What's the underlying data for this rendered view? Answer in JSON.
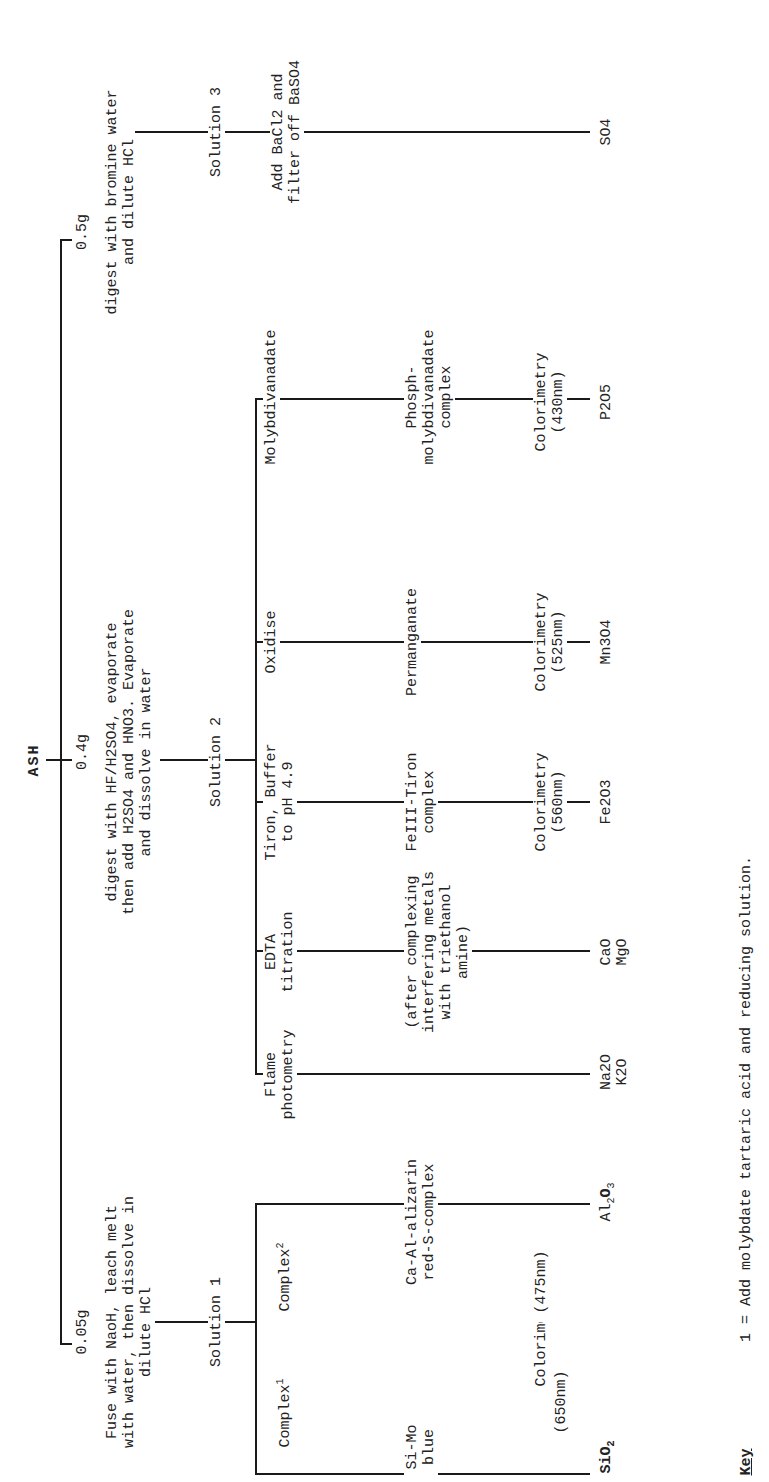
{
  "root": {
    "label": "ASH"
  },
  "branches": [
    {
      "id": "b1",
      "mass": "0.05g",
      "procedure": [
        "Fuse with NaoH, leach melt",
        "with water, then dissolve in",
        "dilute HCl"
      ],
      "solution": "Solution 1",
      "methods": [
        {
          "reagent": "Complex",
          "reagent_sup": "1",
          "complex": [
            "Si-Mo",
            "blue"
          ],
          "measurement": [
            "(650nm)"
          ],
          "product": "SiO",
          "product_sub": "2"
        },
        {
          "reagent": "Complex",
          "reagent_sup": "2",
          "complex": [
            "Ca-Al-alizarin",
            "red-S-complex"
          ],
          "measurement": [
            "(475nm)"
          ],
          "product": "Al",
          "product_sub": "2",
          "product_tail": "O",
          "product_tail_sub": "3"
        }
      ],
      "shared_measurement": "Colorimetry"
    },
    {
      "id": "b2",
      "mass": "0.4g",
      "procedure": [
        "digest with HF/H2SO4, evaporate",
        "then add H2SO4 and HNO3. Evaporate",
        "and dissolve in water"
      ],
      "solution": "Solution 2",
      "methods": [
        {
          "reagent": [
            "Flame",
            "photometry"
          ],
          "detail": [],
          "measurement": [],
          "product": [
            "Na2O",
            "K2O"
          ]
        },
        {
          "reagent": [
            "EDTA",
            "titration"
          ],
          "detail": [
            "(after complexing",
            "interfering metals",
            "with triethanol",
            "amine)"
          ],
          "measurement": [],
          "product": [
            "CaO",
            "MgO"
          ]
        },
        {
          "reagent": [
            "Tiron, Buffer",
            "to pH 4.9"
          ],
          "detail": [
            "FeIII-Tiron",
            "complex"
          ],
          "measurement": [
            "Colorimetry",
            "(560nm)"
          ],
          "product": [
            "Fe2O3"
          ]
        },
        {
          "reagent": [
            "Oxidise"
          ],
          "detail": [
            "Permanganate"
          ],
          "measurement": [
            "Colorimetry",
            "(525nm)"
          ],
          "product": [
            "Mn3O4"
          ]
        },
        {
          "reagent": [
            "Molybdivanadate"
          ],
          "detail": [
            "Phosph-",
            "molybdivanadate",
            "complex"
          ],
          "measurement": [
            "Colorimetry",
            "(430nm)"
          ],
          "product": [
            "P2O5"
          ]
        }
      ]
    },
    {
      "id": "b3",
      "mass": "0.5g",
      "procedure": [
        "digest with bromine water",
        "and dilute HCl"
      ],
      "solution": "Solution 3",
      "methods": [
        {
          "reagent": [
            "Add BaCl2 and",
            "filter off BaSO4"
          ],
          "product": [
            "SO4"
          ]
        }
      ]
    }
  ],
  "key": {
    "title": "Key",
    "note": "1 = Add molybdate tartaric acid and reducing solution."
  }
}
